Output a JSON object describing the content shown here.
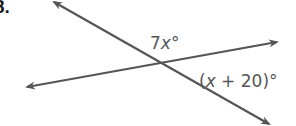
{
  "problem": {
    "number": "8."
  },
  "diagram": {
    "line_color": "#555555",
    "lines": [
      {
        "name": "line-a",
        "x1": 52,
        "y1": 1,
        "x2": 271,
        "y2": 125,
        "arrows": "both"
      },
      {
        "name": "line-b",
        "x1": 25,
        "y1": 87,
        "x2": 279,
        "y2": 42,
        "arrows": "both"
      }
    ],
    "intersection": {
      "x": 155,
      "y": 66
    }
  },
  "labels": {
    "angle_top": {
      "coef": "7",
      "var": "x",
      "deg": "°"
    },
    "angle_right": {
      "open": "(",
      "var": "x",
      "rest": " + 20)",
      "deg": "°"
    }
  }
}
